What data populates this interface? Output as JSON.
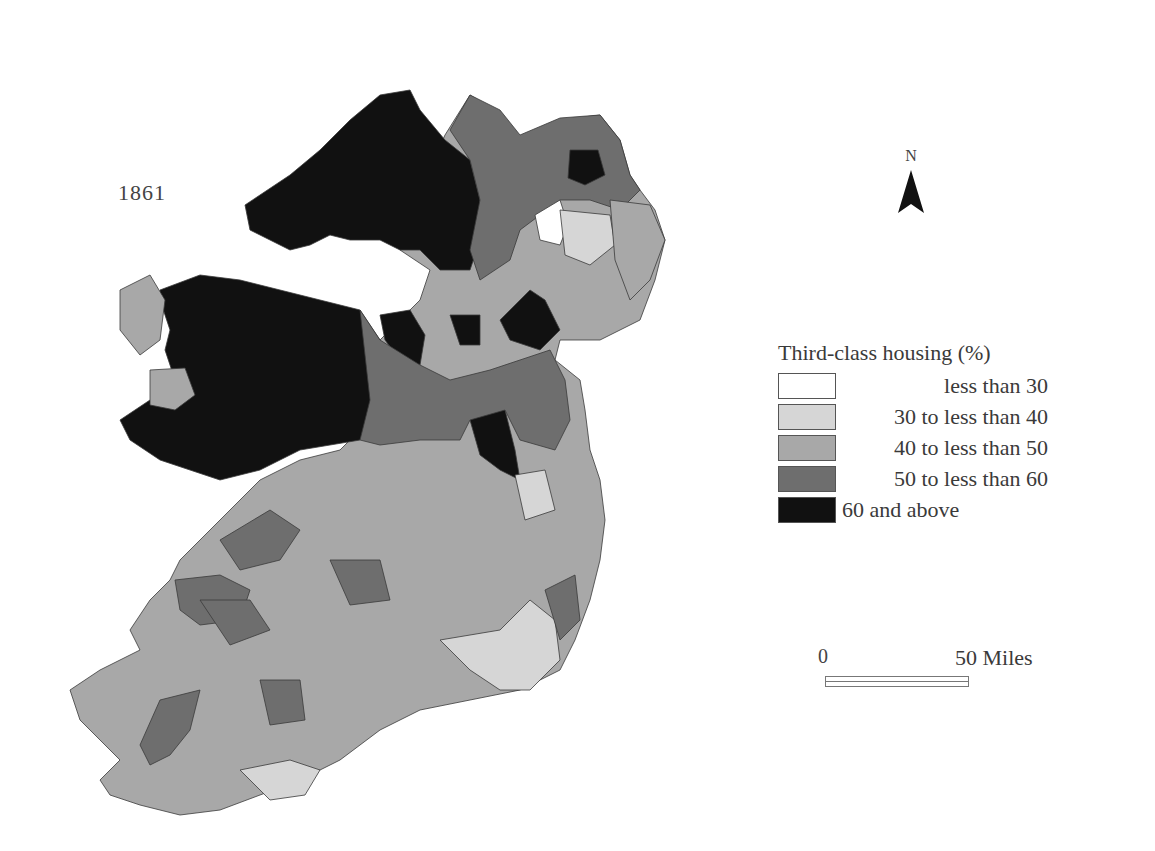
{
  "map": {
    "year": "1861",
    "north_label": "N",
    "legend": {
      "title": "Third-class housing (%)",
      "classes": [
        {
          "label": "less than 30",
          "color": "#ffffff"
        },
        {
          "label": "30 to less than 40",
          "color": "#d6d6d6"
        },
        {
          "label": "40 to less than 50",
          "color": "#a8a8a8"
        },
        {
          "label": "50 to less than 60",
          "color": "#6e6e6e"
        },
        {
          "label": "60 and above",
          "color": "#111111"
        }
      ]
    },
    "scale_bar": {
      "start": "0",
      "end": "50 Miles"
    }
  }
}
